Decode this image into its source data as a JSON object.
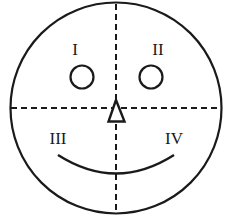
{
  "diagram": {
    "colors": {
      "stroke": "#1a1a1a",
      "background": "#ffffff"
    },
    "quadrants": [
      {
        "id": "I",
        "label": "I",
        "position": "upper-left"
      },
      {
        "id": "II",
        "label": "II",
        "position": "upper-right"
      },
      {
        "id": "III",
        "label": "III",
        "position": "lower-left"
      },
      {
        "id": "IV",
        "label": "IV",
        "position": "lower-right"
      }
    ],
    "features": {
      "left_eye": "small circle in quadrant I",
      "right_eye": "small circle in quadrant II",
      "nose": "hollow triangle pointing up at center",
      "mouth": "smile arc across quadrants III and IV"
    }
  }
}
